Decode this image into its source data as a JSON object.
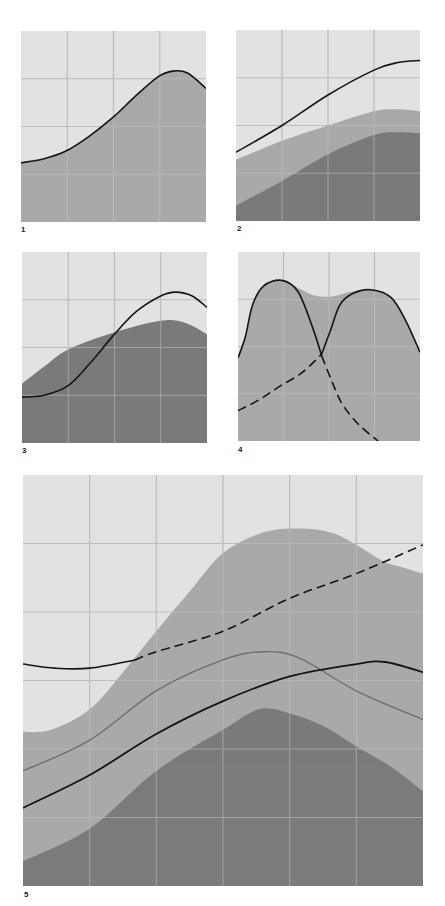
{
  "colors": {
    "background": "#e2e2e2",
    "medium_fill": "#a9a9a9",
    "dark_fill": "#7b7b7b",
    "grid_on_light": "#bdbdbd",
    "grid_on_fill": "#c4c4c4",
    "black_line": "#151515",
    "gray_line": "#6e6e6e"
  },
  "chart_data": [
    {
      "id": "1",
      "type": "area",
      "title": "",
      "xlabel": "",
      "ylabel": "",
      "grid": {
        "cols": 4,
        "rows": 4
      },
      "xlim": [
        0,
        1
      ],
      "ylim": [
        0,
        1
      ],
      "areas": [
        {
          "name": "medium",
          "fill": "medium_fill",
          "points": [
            [
              0,
              0.31
            ],
            [
              0.12,
              0.33
            ],
            [
              0.24,
              0.37
            ],
            [
              0.37,
              0.45
            ],
            [
              0.5,
              0.55
            ],
            [
              0.62,
              0.66
            ],
            [
              0.74,
              0.76
            ],
            [
              0.82,
              0.79
            ],
            [
              0.9,
              0.78
            ],
            [
              1,
              0.7
            ]
          ]
        }
      ],
      "lines": [
        {
          "name": "black",
          "color": "black_line",
          "width": 1.6,
          "style": "solid",
          "points": [
            [
              0,
              0.31
            ],
            [
              0.12,
              0.33
            ],
            [
              0.24,
              0.37
            ],
            [
              0.37,
              0.45
            ],
            [
              0.5,
              0.55
            ],
            [
              0.62,
              0.66
            ],
            [
              0.74,
              0.76
            ],
            [
              0.82,
              0.79
            ],
            [
              0.9,
              0.78
            ],
            [
              1,
              0.7
            ]
          ]
        }
      ]
    },
    {
      "id": "2",
      "type": "area",
      "title": "",
      "xlabel": "",
      "ylabel": "",
      "grid": {
        "cols": 4,
        "rows": 4
      },
      "xlim": [
        0,
        1
      ],
      "ylim": [
        0,
        1
      ],
      "areas": [
        {
          "name": "medium",
          "fill": "medium_fill",
          "points": [
            [
              0,
              0.32
            ],
            [
              0.25,
              0.42
            ],
            [
              0.5,
              0.5
            ],
            [
              0.75,
              0.575
            ],
            [
              0.88,
              0.585
            ],
            [
              1,
              0.575
            ]
          ]
        },
        {
          "name": "dark",
          "fill": "dark_fill",
          "points": [
            [
              0,
              0.08
            ],
            [
              0.25,
              0.21
            ],
            [
              0.5,
              0.35
            ],
            [
              0.75,
              0.45
            ],
            [
              0.88,
              0.465
            ],
            [
              1,
              0.46
            ]
          ]
        }
      ],
      "lines": [
        {
          "name": "black",
          "color": "black_line",
          "width": 1.6,
          "style": "solid",
          "points": [
            [
              0,
              0.36
            ],
            [
              0.25,
              0.5
            ],
            [
              0.5,
              0.66
            ],
            [
              0.75,
              0.79
            ],
            [
              0.88,
              0.83
            ],
            [
              1,
              0.84
            ]
          ]
        }
      ]
    },
    {
      "id": "3",
      "type": "area",
      "title": "",
      "xlabel": "",
      "ylabel": "",
      "grid": {
        "cols": 4,
        "rows": 4
      },
      "xlim": [
        0,
        1
      ],
      "ylim": [
        0,
        1
      ],
      "areas": [
        {
          "name": "dark",
          "fill": "dark_fill",
          "points": [
            [
              0,
              0.31
            ],
            [
              0.12,
              0.4
            ],
            [
              0.25,
              0.49
            ],
            [
              0.5,
              0.58
            ],
            [
              0.75,
              0.64
            ],
            [
              0.88,
              0.63
            ],
            [
              1,
              0.57
            ]
          ]
        }
      ],
      "lines": [
        {
          "name": "black",
          "color": "black_line",
          "width": 1.6,
          "style": "solid",
          "points": [
            [
              0,
              0.24
            ],
            [
              0.12,
              0.25
            ],
            [
              0.25,
              0.3
            ],
            [
              0.37,
              0.42
            ],
            [
              0.5,
              0.57
            ],
            [
              0.62,
              0.69
            ],
            [
              0.75,
              0.77
            ],
            [
              0.83,
              0.79
            ],
            [
              0.92,
              0.77
            ],
            [
              1,
              0.71
            ]
          ]
        }
      ]
    },
    {
      "id": "4",
      "type": "area",
      "title": "",
      "xlabel": "",
      "ylabel": "",
      "grid": {
        "cols": 4,
        "rows": 4
      },
      "xlim": [
        0,
        1
      ],
      "ylim": [
        0,
        1
      ],
      "areas": [
        {
          "name": "medium",
          "fill": "medium_fill",
          "points": [
            [
              0,
              0.44
            ],
            [
              0.04,
              0.55
            ],
            [
              0.08,
              0.72
            ],
            [
              0.14,
              0.82
            ],
            [
              0.24,
              0.85
            ],
            [
              0.33,
              0.81
            ],
            [
              0.42,
              0.77
            ],
            [
              0.52,
              0.765
            ],
            [
              0.62,
              0.79
            ],
            [
              0.73,
              0.8
            ],
            [
              0.84,
              0.76
            ],
            [
              0.92,
              0.64
            ],
            [
              1,
              0.47
            ]
          ]
        }
      ],
      "lines": [
        {
          "name": "left-peak-solid",
          "color": "black_line",
          "width": 1.6,
          "style": "solid",
          "points": [
            [
              0,
              0.44
            ],
            [
              0.04,
              0.55
            ],
            [
              0.08,
              0.72
            ],
            [
              0.14,
              0.82
            ],
            [
              0.24,
              0.85
            ],
            [
              0.33,
              0.79
            ],
            [
              0.41,
              0.6
            ],
            [
              0.46,
              0.45
            ]
          ]
        },
        {
          "name": "left-peak-dashed",
          "color": "black_line",
          "width": 1.6,
          "style": "dashed",
          "points": [
            [
              0.46,
              0.45
            ],
            [
              0.51,
              0.33
            ],
            [
              0.57,
              0.2
            ],
            [
              0.66,
              0.09
            ],
            [
              0.77,
              0.0
            ]
          ]
        },
        {
          "name": "right-peak-dashed",
          "color": "black_line",
          "width": 1.6,
          "style": "dashed",
          "points": [
            [
              0,
              0.16
            ],
            [
              0.12,
              0.22
            ],
            [
              0.23,
              0.29
            ],
            [
              0.35,
              0.36
            ],
            [
              0.46,
              0.46
            ]
          ]
        },
        {
          "name": "right-peak-solid",
          "color": "black_line",
          "width": 1.6,
          "style": "solid",
          "points": [
            [
              0.46,
              0.46
            ],
            [
              0.51,
              0.59
            ],
            [
              0.56,
              0.72
            ],
            [
              0.63,
              0.78
            ],
            [
              0.73,
              0.8
            ],
            [
              0.84,
              0.76
            ],
            [
              0.92,
              0.64
            ],
            [
              1,
              0.47
            ]
          ]
        }
      ]
    },
    {
      "id": "5",
      "type": "area",
      "title": "",
      "xlabel": "",
      "ylabel": "",
      "grid": {
        "cols": 6,
        "rows": 6
      },
      "xlim": [
        0,
        1
      ],
      "ylim": [
        0,
        1
      ],
      "areas": [
        {
          "name": "medium",
          "fill": "medium_fill",
          "points": [
            [
              0,
              0.375
            ],
            [
              0.07,
              0.38
            ],
            [
              0.167,
              0.43
            ],
            [
              0.25,
              0.52
            ],
            [
              0.333,
              0.62
            ],
            [
              0.42,
              0.72
            ],
            [
              0.5,
              0.81
            ],
            [
              0.6,
              0.86
            ],
            [
              0.69,
              0.87
            ],
            [
              0.77,
              0.86
            ],
            [
              0.833,
              0.83
            ],
            [
              0.9,
              0.79
            ],
            [
              0.95,
              0.775
            ],
            [
              1,
              0.76
            ]
          ]
        },
        {
          "name": "dark",
          "fill": "dark_fill",
          "points": [
            [
              0,
              0.06
            ],
            [
              0.167,
              0.14
            ],
            [
              0.333,
              0.28
            ],
            [
              0.5,
              0.38
            ],
            [
              0.59,
              0.43
            ],
            [
              0.667,
              0.42
            ],
            [
              0.75,
              0.39
            ],
            [
              0.833,
              0.34
            ],
            [
              0.92,
              0.29
            ],
            [
              1,
              0.23
            ]
          ]
        }
      ],
      "lines": [
        {
          "name": "gray",
          "color": "gray_line",
          "width": 1.4,
          "style": "solid",
          "points": [
            [
              0,
              0.28
            ],
            [
              0.167,
              0.355
            ],
            [
              0.333,
              0.475
            ],
            [
              0.5,
              0.55
            ],
            [
              0.6,
              0.57
            ],
            [
              0.69,
              0.555
            ],
            [
              0.833,
              0.475
            ],
            [
              1,
              0.405
            ]
          ]
        },
        {
          "name": "black-lower",
          "color": "black_line",
          "width": 1.8,
          "style": "solid",
          "points": [
            [
              0,
              0.19
            ],
            [
              0.167,
              0.27
            ],
            [
              0.333,
              0.37
            ],
            [
              0.5,
              0.45
            ],
            [
              0.667,
              0.51
            ],
            [
              0.833,
              0.54
            ],
            [
              0.905,
              0.545
            ],
            [
              1,
              0.52
            ]
          ]
        },
        {
          "name": "black-top-solid",
          "color": "black_line",
          "width": 1.6,
          "style": "solid",
          "points": [
            [
              0,
              0.54
            ],
            [
              0.08,
              0.53
            ],
            [
              0.167,
              0.53
            ],
            [
              0.28,
              0.55
            ]
          ]
        },
        {
          "name": "black-top-dashed",
          "color": "black_line",
          "width": 1.6,
          "style": "dashed",
          "points": [
            [
              0.28,
              0.55
            ],
            [
              0.333,
              0.57
            ],
            [
              0.5,
              0.62
            ],
            [
              0.667,
              0.7
            ],
            [
              0.833,
              0.76
            ],
            [
              1,
              0.83
            ]
          ]
        }
      ]
    }
  ],
  "panels": [
    {
      "label": "1"
    },
    {
      "label": "2"
    },
    {
      "label": "3"
    },
    {
      "label": "4"
    },
    {
      "label": "5"
    }
  ]
}
